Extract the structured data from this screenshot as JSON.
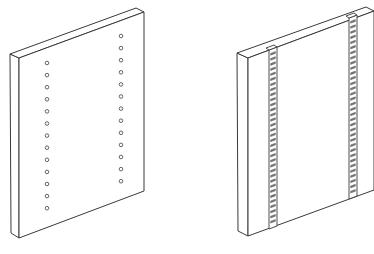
{
  "figure": {
    "panels": [
      {
        "id": "panel-with-holes",
        "label": "Panel with two columns of drilled holes",
        "top_face": [
          [
            10,
            54
          ],
          [
            136,
            8
          ],
          [
            144,
            12
          ],
          [
            19,
            58
          ]
        ],
        "front_face": [
          [
            19,
            58
          ],
          [
            144,
            12
          ],
          [
            144,
            191
          ],
          [
            19,
            238
          ]
        ],
        "side_face": [
          [
            10,
            54
          ],
          [
            19,
            58
          ],
          [
            19,
            238
          ],
          [
            11,
            233
          ]
        ],
        "hole_columns": [
          {
            "x": 47,
            "y_start": 63,
            "count": 13,
            "spacing": 12.1,
            "slope": 0
          },
          {
            "x": 121,
            "y_start": 36,
            "count": 13,
            "spacing": 12.1,
            "slope": 0
          }
        ],
        "hole_radius": 1.8
      },
      {
        "id": "panel-with-rails",
        "label": "Panel with two slotted vertical rails",
        "top_face": [
          [
            237,
            53
          ],
          [
            366,
            7
          ],
          [
            374,
            11
          ],
          [
            248,
            58
          ]
        ],
        "front_face": [
          [
            248,
            58
          ],
          [
            374,
            11
          ],
          [
            374,
            190
          ],
          [
            248,
            236
          ]
        ],
        "side_face": [
          [
            237,
            53
          ],
          [
            248,
            58
          ],
          [
            248,
            236
          ],
          [
            238,
            231
          ]
        ],
        "rails": [
          {
            "x_left": 269,
            "x_right": 277,
            "y_top": 50,
            "y_bottom": 229,
            "slot_count": 34
          },
          {
            "x_left": 349,
            "x_right": 357,
            "y_top": 18,
            "y_bottom": 199,
            "slot_count": 34
          }
        ]
      }
    ],
    "colors": {
      "background": "#ffffff",
      "line": "#3a3a3a",
      "slot": "#7a7a7a"
    }
  }
}
